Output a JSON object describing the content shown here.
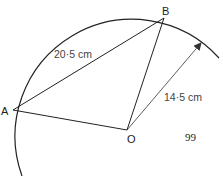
{
  "diagram": {
    "points": {
      "A": "A",
      "B": "B",
      "O": "O"
    },
    "labels": {
      "chord_AB": "20·5 cm",
      "radius": "14·5 cm"
    },
    "page_number": "99",
    "colors": {
      "stroke": "#222222",
      "text": "#222222",
      "measure_text": "#444444"
    }
  }
}
